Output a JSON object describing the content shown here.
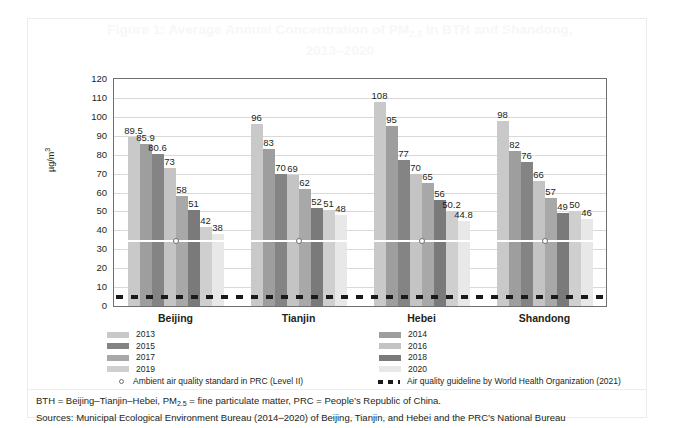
{
  "figure": {
    "title_line1": "Figure 1: Average Annual Concentration of PM",
    "title_sub": "2.5",
    "title_line1_tail": " in BTH and Shandong,",
    "title_line2": "2013–2020"
  },
  "chart_data": {
    "type": "bar",
    "title": "Figure 1: Average Annual Concentration of PM2.5 in BTH and Shandong, 2013–2020",
    "xlabel": "",
    "ylabel": "µg/m³",
    "ylim": [
      0,
      120
    ],
    "ytick_step": 10,
    "yticks": [
      "120",
      "110",
      "100",
      "90",
      "80",
      "70",
      "60",
      "50",
      "40",
      "30",
      "20",
      "10",
      "0"
    ],
    "grid": true,
    "legend_position": "bottom",
    "categories": [
      "Beijing",
      "Tianjin",
      "Hebei",
      "Shandong"
    ],
    "series": [
      {
        "name": "2013",
        "color": "#c9c9c9",
        "values": [
          89.5,
          96,
          108,
          98
        ]
      },
      {
        "name": "2014",
        "color": "#9e9e9e",
        "values": [
          85.9,
          83,
          95,
          82
        ]
      },
      {
        "name": "2015",
        "color": "#848484",
        "values": [
          80.6,
          70,
          77,
          76
        ]
      },
      {
        "name": "2016",
        "color": "#c4c4c4",
        "values": [
          73,
          69,
          70,
          66
        ]
      },
      {
        "name": "2017",
        "color": "#a8a8a8",
        "values": [
          58,
          62,
          65,
          57
        ]
      },
      {
        "name": "2018",
        "color": "#7a7a7a",
        "values": [
          51,
          52,
          56,
          49
        ]
      },
      {
        "name": "2019",
        "color": "#cfcfcf",
        "values": [
          42,
          51,
          50.2,
          50
        ]
      },
      {
        "name": "2020",
        "color": "#e8e8e8",
        "values": [
          38,
          48,
          44.8,
          46
        ]
      }
    ],
    "value_labels": {
      "Beijing": [
        "89.5",
        "85.9",
        "80.6",
        "73",
        "58",
        "51",
        "42",
        "38"
      ],
      "Tianjin": [
        "96",
        "83",
        "70",
        "69",
        "62",
        "52",
        "51",
        "48"
      ],
      "Hebei": [
        "108",
        "95",
        "77",
        "70",
        "65",
        "56",
        "50.2",
        "44.8"
      ],
      "Shandong": [
        "98",
        "82",
        "76",
        "66",
        "57",
        "49",
        "50",
        "46"
      ]
    },
    "reference_lines": [
      {
        "name": "prc-standard",
        "label": "Ambient air quality standard in PRC (Level II)",
        "value": 35,
        "style": "solid-white-with-circle-markers",
        "color": "#ffffff"
      },
      {
        "name": "who-guideline",
        "label": "Air quality guideline by World Health Organization (2021)",
        "value": 5,
        "style": "dashed",
        "color": "#1a1a1a"
      }
    ]
  },
  "legend": {
    "left_items": [
      {
        "label": "2013",
        "color": "#c9c9c9"
      },
      {
        "label": "2015",
        "color": "#848484"
      },
      {
        "label": "2017",
        "color": "#a8a8a8"
      },
      {
        "label": "2019",
        "color": "#cfcfcf"
      }
    ],
    "right_items": [
      {
        "label": "2014",
        "color": "#9e9e9e"
      },
      {
        "label": "2016",
        "color": "#c4c4c4"
      },
      {
        "label": "2018",
        "color": "#7a7a7a"
      },
      {
        "label": "2020",
        "color": "#e8e8e8"
      }
    ],
    "prc_label": "Ambient air quality standard in PRC (Level II)",
    "who_label": "Air quality guideline by World Health Organization (2021)"
  },
  "notes": {
    "line1_a": "BTH = Beijing–Tianjin–Hebei, PM",
    "line1_sub": "2.5",
    "line1_b": " = fine particulate matter, PRC = People’s Republic of China.",
    "line2": "Sources: Municipal Ecological Environment Bureau (2014–2020) of Beijing, Tianjin, and Hebei and the PRC’s National Bureau"
  }
}
